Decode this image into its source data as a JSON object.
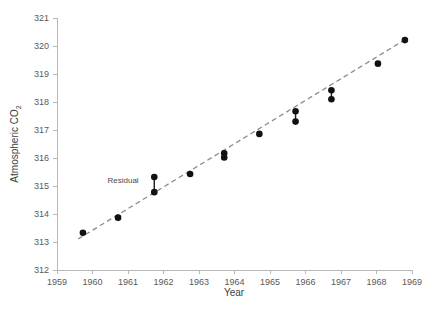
{
  "chart_data": {
    "type": "scatter",
    "title": "",
    "xlabel": "Year",
    "ylabel_main": "Atmospheric CO",
    "ylabel_sub": "2",
    "ylabel_full": "Atmospheric CO2",
    "xlim": [
      1959,
      1969
    ],
    "ylim": [
      312,
      321
    ],
    "xticks": [
      1959,
      1960,
      1961,
      1962,
      1963,
      1964,
      1965,
      1966,
      1967,
      1968,
      1969
    ],
    "yticks": [
      312,
      313,
      314,
      315,
      316,
      317,
      318,
      319,
      320,
      321
    ],
    "grid": false,
    "legend": "none",
    "x": [
      1959.73,
      1960.72,
      1961.74,
      1961.74,
      1962.75,
      1963.71,
      1963.71,
      1964.7,
      1965.72,
      1965.72,
      1966.73,
      1966.73,
      1968.04,
      1968.8
    ],
    "y": [
      313.33,
      313.87,
      315.32,
      314.78,
      315.43,
      316.17,
      316.02,
      316.86,
      317.67,
      317.3,
      318.42,
      318.1,
      319.37,
      320.21
    ],
    "points": [
      {
        "x": 1959.73,
        "y": 313.33,
        "label": "1959.7, 313.33"
      },
      {
        "x": 1960.72,
        "y": 313.87,
        "label": "1960.7, 313.87"
      },
      {
        "x": 1961.74,
        "y": 315.32,
        "label": "1961.7, 315.32"
      },
      {
        "x": 1961.74,
        "y": 314.78,
        "label": "1961.7, 314.78"
      },
      {
        "x": 1962.75,
        "y": 315.43,
        "label": "1962.8, 315.43"
      },
      {
        "x": 1963.71,
        "y": 316.17,
        "label": "1963.7, 316.17"
      },
      {
        "x": 1963.71,
        "y": 316.02,
        "label": "1963.7, 316.02"
      },
      {
        "x": 1964.7,
        "y": 316.86,
        "label": "1964.7, 316.86"
      },
      {
        "x": 1965.72,
        "y": 317.67,
        "label": "1965.7, 317.67"
      },
      {
        "x": 1965.72,
        "y": 317.3,
        "label": "1965.7, 317.30"
      },
      {
        "x": 1966.73,
        "y": 318.42,
        "label": "1966.7, 318.42"
      },
      {
        "x": 1966.73,
        "y": 318.1,
        "label": "1966.7, 318.10"
      },
      {
        "x": 1968.04,
        "y": 319.37,
        "label": "1968.0, 319.37"
      },
      {
        "x": 1968.8,
        "y": 320.21,
        "label": "1968.8, 320.21"
      }
    ],
    "residual_segments": [
      {
        "x": 1961.74,
        "y_top": 315.32,
        "y_bottom": 314.78
      },
      {
        "x": 1963.71,
        "y_top": 316.17,
        "y_bottom": 316.02
      },
      {
        "x": 1965.72,
        "y_top": 317.67,
        "y_bottom": 317.3
      },
      {
        "x": 1966.73,
        "y_top": 318.42,
        "y_bottom": 318.1
      }
    ],
    "trendline": {
      "name": "least-squares fit",
      "style": "dashed",
      "color": "#8c8c8c",
      "x_start": 1959.6,
      "y_start": 313.11,
      "x_end": 1968.85,
      "y_end": 320.26
    },
    "annotations": [
      {
        "text": "Residual",
        "x": 1961.3,
        "y": 315.1,
        "target_x": 1961.74
      }
    ],
    "colors": {
      "point": "#111111",
      "trend": "#8c8c8c",
      "axis": "#b8b8b8",
      "text": "#4a4a4a",
      "background": "#ffffff"
    }
  }
}
